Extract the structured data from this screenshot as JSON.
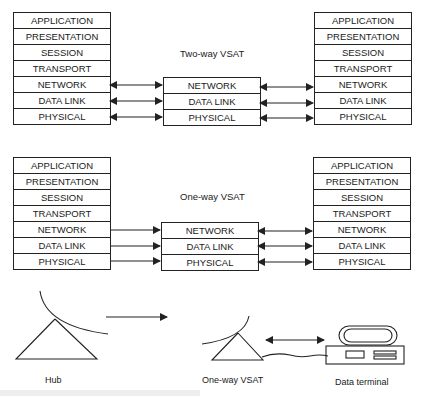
{
  "two_way": {
    "title": "Two-way VSAT",
    "left_stack": [
      "APPLICATION",
      "PRESENTATION",
      "SESSION",
      "TRANSPORT",
      "NETWORK",
      "DATA LINK",
      "PHYSICAL"
    ],
    "middle_stack": [
      "NETWORK",
      "DATA LINK",
      "PHYSICAL"
    ],
    "right_stack": [
      "APPLICATION",
      "PRESENTATION",
      "SESSION",
      "TRANSPORT",
      "NETWORK",
      "DATA LINK",
      "PHYSICAL"
    ],
    "left_links": "bidirectional",
    "right_links": "bidirectional"
  },
  "one_way": {
    "title": "One-way VSAT",
    "left_stack": [
      "APPLICATION",
      "PRESENTATION",
      "SESSION",
      "TRANSPORT",
      "NETWORK",
      "DATA LINK",
      "PHYSICAL"
    ],
    "middle_stack": [
      "NETWORK",
      "DATA LINK",
      "PHYSICAL"
    ],
    "right_stack": [
      "APPLICATION",
      "PRESENTATION",
      "SESSION",
      "TRANSPORT",
      "NETWORK",
      "DATA LINK",
      "PHYSICAL"
    ],
    "left_links": "unidirectional",
    "right_links": "bidirectional"
  },
  "bottom": {
    "hub_label": "Hub",
    "vsat_label": "One-way VSAT",
    "terminal_label": "Data terminal",
    "hub_to_vsat": "unidirectional",
    "vsat_to_terminal": "bidirectional"
  },
  "colors": {
    "line": "#222222",
    "background": "#ffffff"
  }
}
